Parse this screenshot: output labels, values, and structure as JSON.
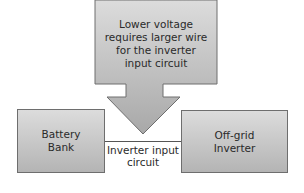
{
  "diagram": {
    "callout": {
      "text": "Lower voltage\nrequires larger wire\nfor the inverter\ninput circuit",
      "shape": "down-arrow-callout"
    },
    "nodes": [
      {
        "id": "battery-bank",
        "label": "Battery\nBank"
      },
      {
        "id": "off-grid-inverter",
        "label": "Off-grid\nInverter"
      }
    ],
    "edges": [
      {
        "from": "battery-bank",
        "to": "off-grid-inverter",
        "label": "Inverter input\ncircuit"
      }
    ],
    "colors": {
      "fill_top": "#dcdcdc",
      "fill_bottom": "#b4b4b4",
      "border": "#6e6e6e",
      "line": "#555555",
      "text": "#2a2a2a"
    }
  }
}
